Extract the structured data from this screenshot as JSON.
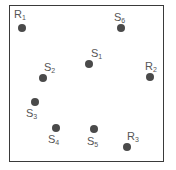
{
  "diagram": {
    "points": [
      {
        "id": "R1",
        "letter": "R",
        "sub": "1",
        "x": 22,
        "y": 28,
        "lx": 14,
        "ly": 9
      },
      {
        "id": "S6",
        "letter": "S",
        "sub": "6",
        "x": 121,
        "y": 28,
        "lx": 114,
        "ly": 12
      },
      {
        "id": "S1",
        "letter": "S",
        "sub": "1",
        "x": 89,
        "y": 64,
        "lx": 91,
        "ly": 48
      },
      {
        "id": "S2",
        "letter": "S",
        "sub": "2",
        "x": 43,
        "y": 78,
        "lx": 44,
        "ly": 62
      },
      {
        "id": "R2",
        "letter": "R",
        "sub": "2",
        "x": 150,
        "y": 77,
        "lx": 145,
        "ly": 61
      },
      {
        "id": "S3",
        "letter": "S",
        "sub": "3",
        "x": 35,
        "y": 102,
        "lx": 26,
        "ly": 108
      },
      {
        "id": "S4",
        "letter": "S",
        "sub": "4",
        "x": 56,
        "y": 128,
        "lx": 48,
        "ly": 134
      },
      {
        "id": "S5",
        "letter": "S",
        "sub": "5",
        "x": 94,
        "y": 129,
        "lx": 87,
        "ly": 136
      },
      {
        "id": "R3",
        "letter": "R",
        "sub": "3",
        "x": 127,
        "y": 147,
        "lx": 127,
        "ly": 131
      }
    ],
    "colors": {
      "dot": "#4a4a4a",
      "label": "#555555",
      "border": "#3a3a3a"
    }
  }
}
